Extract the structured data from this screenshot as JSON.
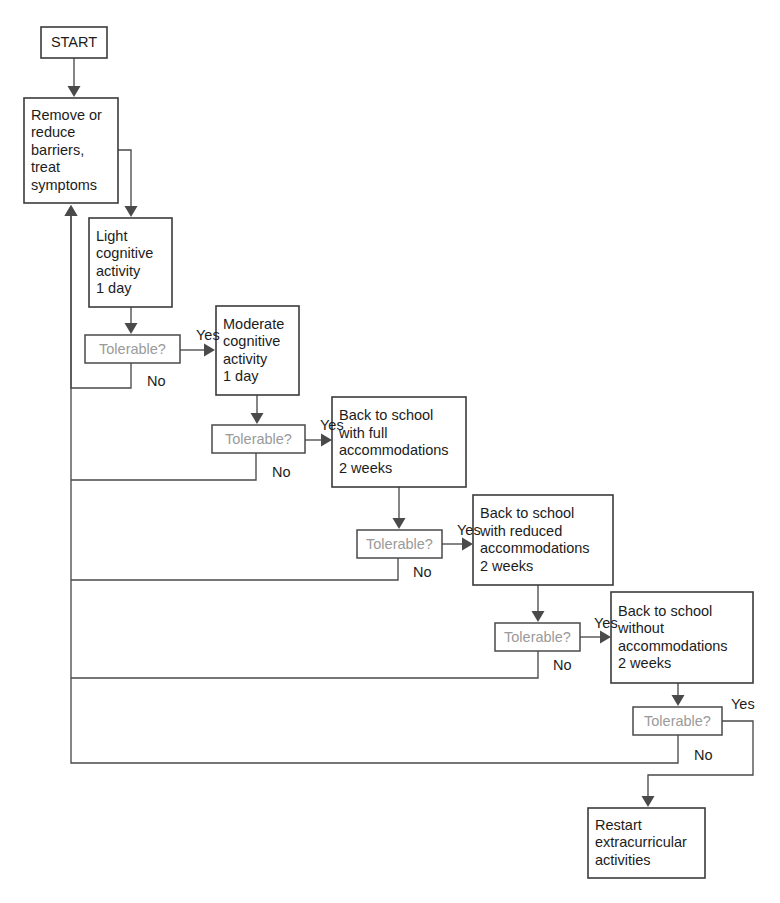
{
  "diagram": {
    "background_color": "#ffffff",
    "box_stroke_color": "#3b3b3b",
    "line_color": "#4a4a4a",
    "text_color": "#1c1c1c",
    "decision_text_color": "#9a9a9a"
  },
  "nodes": [
    {
      "id": "start",
      "type": "terminator",
      "lines": [
        "START"
      ],
      "x": 41,
      "y": 27,
      "w": 66,
      "h": 31
    },
    {
      "id": "remove-reduce",
      "type": "process",
      "lines": [
        "Remove or",
        "reduce",
        "barriers,",
        "treat",
        "symptoms"
      ],
      "x": 24,
      "y": 98,
      "w": 94,
      "h": 105
    },
    {
      "id": "light-cognitive",
      "type": "process",
      "lines": [
        "Light",
        "cognitive",
        "activity",
        "1 day"
      ],
      "x": 89,
      "y": 218,
      "w": 83,
      "h": 89
    },
    {
      "id": "tolerable-1",
      "type": "decision",
      "lines": [
        "Tolerable?"
      ],
      "x": 85,
      "y": 335,
      "w": 95,
      "h": 28
    },
    {
      "id": "moderate-cognitive",
      "type": "process",
      "lines": [
        "Moderate",
        "cognitive",
        "activity",
        "1 day"
      ],
      "x": 216,
      "y": 306,
      "w": 83,
      "h": 89
    },
    {
      "id": "tolerable-2",
      "type": "decision",
      "lines": [
        "Tolerable?"
      ],
      "x": 212,
      "y": 425,
      "w": 93,
      "h": 28
    },
    {
      "id": "school-full",
      "type": "process",
      "lines": [
        "Back to school",
        "with full",
        "accommodations",
        "2 weeks"
      ],
      "x": 332,
      "y": 397,
      "w": 134,
      "h": 90
    },
    {
      "id": "tolerable-3",
      "type": "decision",
      "lines": [
        "Tolerable?"
      ],
      "x": 357,
      "y": 530,
      "w": 85,
      "h": 28
    },
    {
      "id": "school-reduced",
      "type": "process",
      "lines": [
        "Back to school",
        "with reduced",
        "accommodations",
        "2 weeks"
      ],
      "x": 473,
      "y": 495,
      "w": 140,
      "h": 90
    },
    {
      "id": "tolerable-4",
      "type": "decision",
      "lines": [
        "Tolerable?"
      ],
      "x": 495,
      "y": 623,
      "w": 85,
      "h": 28
    },
    {
      "id": "school-without",
      "type": "process",
      "lines": [
        "Back to school",
        "without",
        "accommodations",
        "2 weeks"
      ],
      "x": 611,
      "y": 592,
      "w": 142,
      "h": 91
    },
    {
      "id": "tolerable-5",
      "type": "decision",
      "lines": [
        "Tolerable?"
      ],
      "x": 633,
      "y": 707,
      "w": 89,
      "h": 28
    },
    {
      "id": "restart-extracurricular",
      "type": "process",
      "lines": [
        "Restart",
        "extracurricular",
        "activities"
      ],
      "x": 588,
      "y": 808,
      "w": 117,
      "h": 70
    }
  ],
  "edge_labels": [
    {
      "id": "yes-1",
      "text": "Yes",
      "x": 196,
      "y": 336
    },
    {
      "id": "no-1",
      "text": "No",
      "x": 147,
      "y": 382
    },
    {
      "id": "yes-2",
      "text": "Yes",
      "x": 320,
      "y": 426
    },
    {
      "id": "no-2",
      "text": "No",
      "x": 272,
      "y": 473
    },
    {
      "id": "yes-3",
      "text": "Yes",
      "x": 457,
      "y": 531
    },
    {
      "id": "no-3",
      "text": "No",
      "x": 413,
      "y": 573
    },
    {
      "id": "yes-4",
      "text": "Yes",
      "x": 594,
      "y": 624
    },
    {
      "id": "no-4",
      "text": "No",
      "x": 553,
      "y": 666
    },
    {
      "id": "yes-5",
      "text": "Yes",
      "x": 731,
      "y": 705
    },
    {
      "id": "no-5",
      "text": "No",
      "x": 694,
      "y": 756
    }
  ],
  "edges": [
    {
      "id": "start-to-remove",
      "from": "start",
      "to": "remove-reduce",
      "path": "M 74 58 L 74 90",
      "arrow": {
        "x": 74,
        "y": 97,
        "dir": "down"
      }
    },
    {
      "id": "remove-to-light",
      "from": "remove-reduce",
      "to": "light-cognitive",
      "path": "M 118 150 L 131 150 L 131 210",
      "arrow": {
        "x": 131,
        "y": 217,
        "dir": "down"
      }
    },
    {
      "id": "light-to-tolerable1",
      "from": "light-cognitive",
      "to": "tolerable-1",
      "path": "M 131 307 L 131 327",
      "arrow": {
        "x": 131,
        "y": 334,
        "dir": "down"
      }
    },
    {
      "id": "tolerable1-yes",
      "from": "tolerable-1",
      "to": "moderate-cognitive",
      "label": "Yes",
      "path": "M 180 350 L 208 350",
      "arrow": {
        "x": 215,
        "y": 350,
        "dir": "right"
      }
    },
    {
      "id": "tolerable1-no",
      "from": "tolerable-1",
      "to": "remove-reduce",
      "label": "No",
      "path": "M 131 363 L 131 388 L 71 388 L 71 212",
      "arrow": {
        "x": 71,
        "y": 205,
        "dir": "up"
      }
    },
    {
      "id": "moderate-to-tolerable2",
      "from": "moderate-cognitive",
      "to": "tolerable-2",
      "path": "M 257 395 L 257 417",
      "arrow": {
        "x": 257,
        "y": 424,
        "dir": "down"
      }
    },
    {
      "id": "tolerable2-yes",
      "from": "tolerable-2",
      "to": "school-full",
      "label": "Yes",
      "path": "M 305 440 L 325 440",
      "arrow": {
        "x": 332,
        "y": 440,
        "dir": "right"
      }
    },
    {
      "id": "tolerable2-no",
      "from": "tolerable-2",
      "to": "return-bus",
      "label": "No",
      "path": "M 256 453 L 256 480 L 71 480",
      "arrow": null
    },
    {
      "id": "schoolfull-to-tolerable3",
      "from": "school-full",
      "to": "tolerable-3",
      "path": "M 399 487 L 399 522",
      "arrow": {
        "x": 399,
        "y": 529,
        "dir": "down"
      }
    },
    {
      "id": "tolerable3-yes",
      "from": "tolerable-3",
      "to": "school-reduced",
      "label": "Yes",
      "path": "M 442 544 L 466 544",
      "arrow": {
        "x": 473,
        "y": 544,
        "dir": "right"
      }
    },
    {
      "id": "tolerable3-no",
      "from": "tolerable-3",
      "to": "return-bus",
      "label": "No",
      "path": "M 398 558 L 398 580 L 71 580",
      "arrow": null
    },
    {
      "id": "schoolreduced-to-tolerable4",
      "from": "school-reduced",
      "to": "tolerable-4",
      "path": "M 538 585 L 538 615",
      "arrow": {
        "x": 538,
        "y": 622,
        "dir": "down"
      }
    },
    {
      "id": "tolerable4-yes",
      "from": "tolerable-4",
      "to": "school-without",
      "label": "Yes",
      "path": "M 580 637 L 604 637",
      "arrow": {
        "x": 611,
        "y": 637,
        "dir": "right"
      }
    },
    {
      "id": "tolerable4-no",
      "from": "tolerable-4",
      "to": "return-bus",
      "label": "No",
      "path": "M 538 651 L 538 678 L 71 678",
      "arrow": null
    },
    {
      "id": "schoolwithout-to-tolerable5",
      "from": "school-without",
      "to": "tolerable-5",
      "path": "M 678 683 L 678 699",
      "arrow": {
        "x": 678,
        "y": 706,
        "dir": "down"
      }
    },
    {
      "id": "tolerable5-no",
      "from": "tolerable-5",
      "to": "return-bus",
      "label": "No",
      "path": "M 678 735 L 678 763 L 71 763 L 71 212",
      "arrow": {
        "x": 71,
        "y": 205,
        "dir": "up"
      }
    },
    {
      "id": "tolerable5-yes",
      "from": "tolerable-5",
      "to": "restart-extracurricular",
      "label": "Yes",
      "path": "M 722 721 L 753 721 L 753 775 L 648 775 L 648 800",
      "arrow": {
        "x": 648,
        "y": 807,
        "dir": "down"
      }
    }
  ]
}
